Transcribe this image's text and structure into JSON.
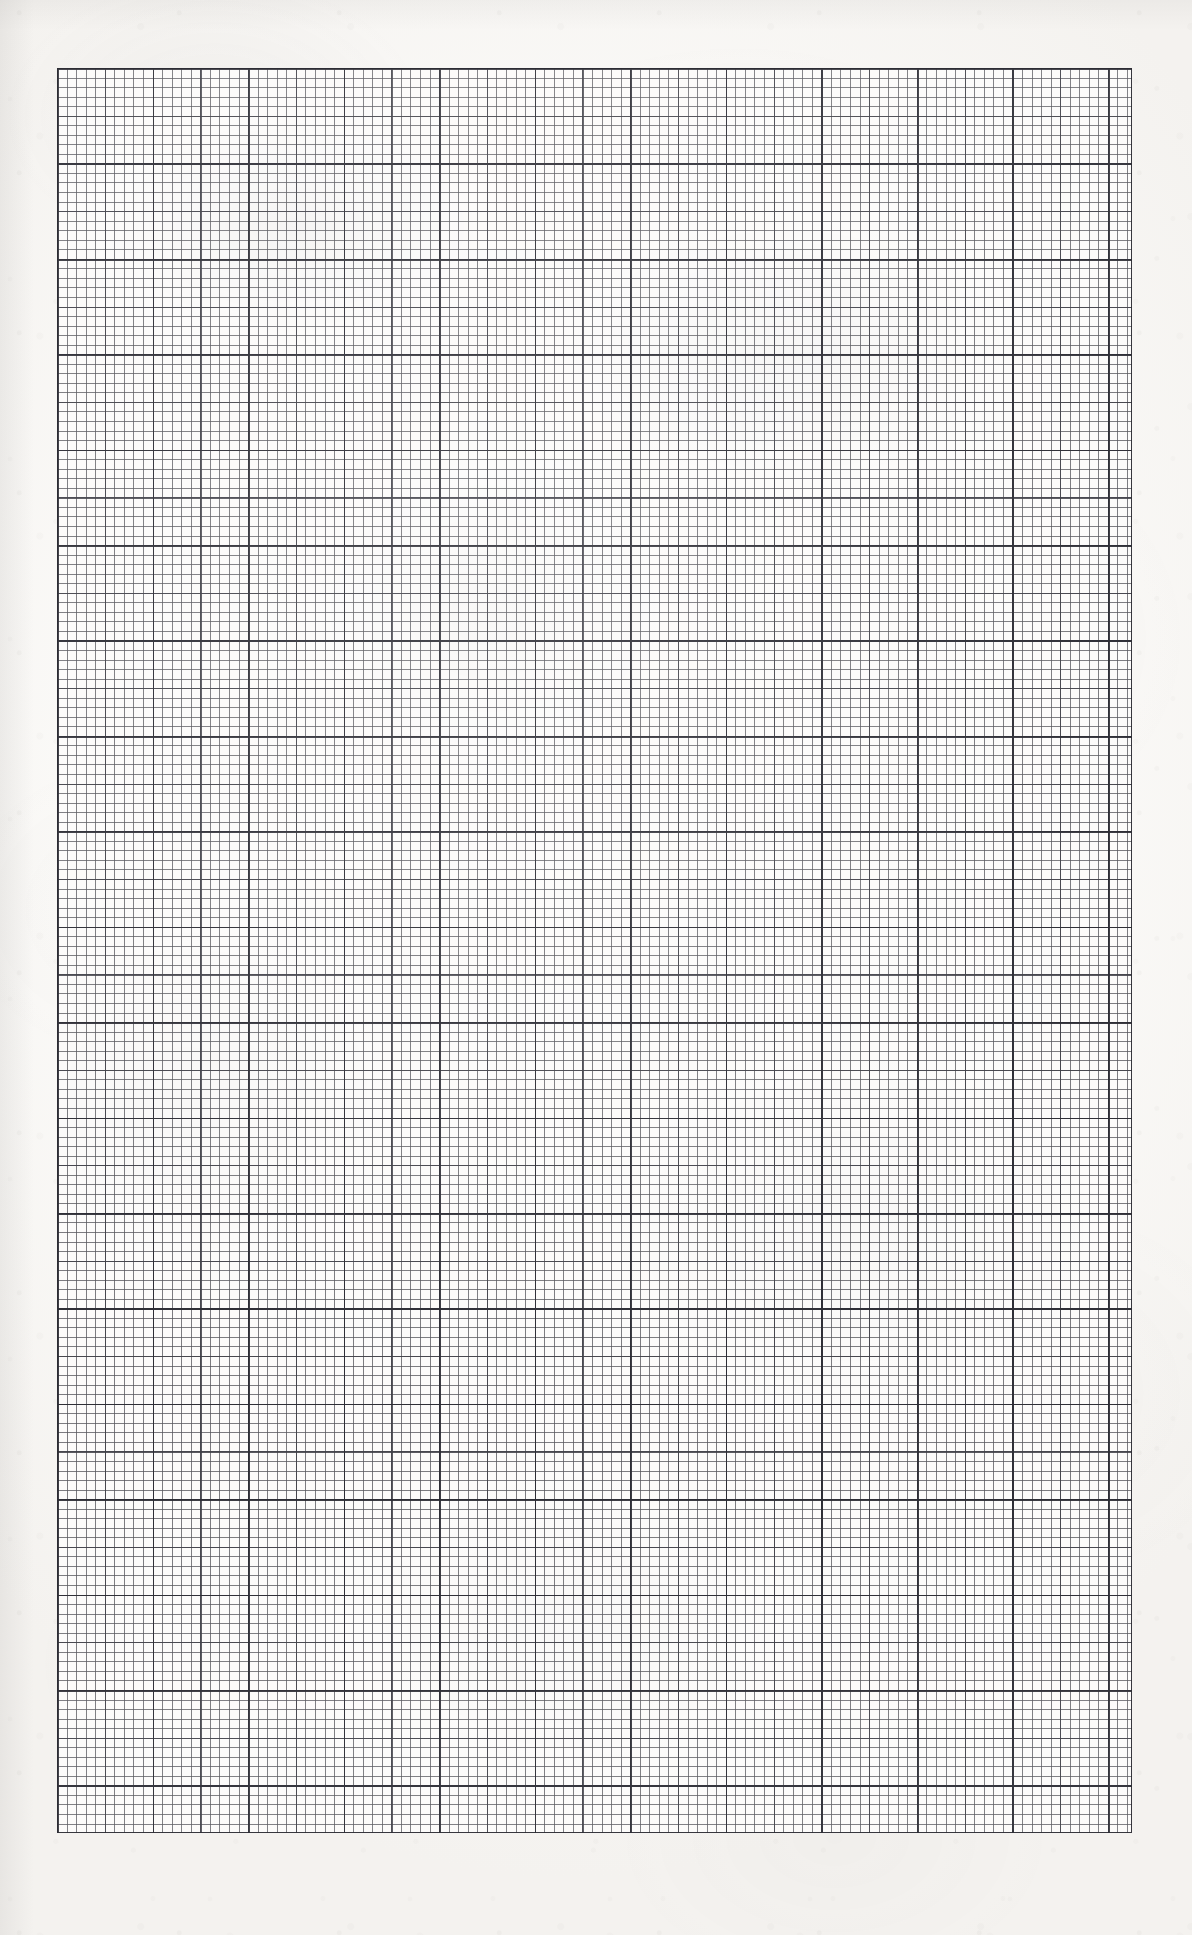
{
  "document": {
    "kind": "scanned-graph-paper",
    "title": "Graph Paper Sheet",
    "description": "Blank scanned sheet of millimetre / engineering graph paper. No text, labels, numbers or drawn marks are present on the page.",
    "page_width_px": 1192,
    "page_height_px": 1935,
    "paper_color": "#faf9f7",
    "has_text": false,
    "has_handwriting": false,
    "has_plotted_data": false
  },
  "grid": {
    "name": "millimetre-grid",
    "left_px": 57,
    "top_px": 68,
    "width_px": 1075,
    "height_px": 1765,
    "fine_cell_width_px": 9.554,
    "fine_cell_height_px": 9.541,
    "medium_every_n_cells": 5,
    "major_every_n_cells": 10,
    "fine_columns": 112,
    "fine_rows": 185,
    "major_columns": 11,
    "major_rows": 18,
    "fine_line_color": "#58585e",
    "medium_line_color": "#3e3e46",
    "major_line_color": "#2c2c34",
    "border_color": "#2c2c34",
    "border_width_px": 1.8
  },
  "chart_data": {
    "type": "table",
    "title": "",
    "subtitle": "",
    "xlabel": "",
    "ylabel": "",
    "categories": [],
    "values": [],
    "series": [],
    "annotations": [],
    "legend": [],
    "grid": true,
    "note": "Blank graph paper — the ruled grid carries no plotted series or tick labels."
  }
}
